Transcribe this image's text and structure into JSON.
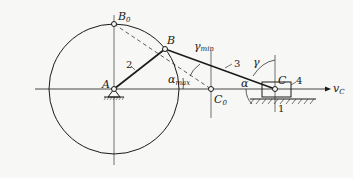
{
  "diagram": {
    "type": "slider-crank mechanism",
    "points": {
      "B0": {
        "label": "B",
        "sub": "0"
      },
      "B": {
        "label": "B"
      },
      "A": {
        "label": "A"
      },
      "C0": {
        "label": "C",
        "sub": "0"
      },
      "C": {
        "label": "C"
      }
    },
    "links": {
      "ground": "1",
      "crank": "2",
      "connecting_rod": "3",
      "slider": "4"
    },
    "angles": {
      "gamma_min": {
        "symbol": "γ",
        "sub": "min"
      },
      "gamma": {
        "symbol": "γ"
      },
      "alpha": {
        "symbol": "α"
      },
      "alpha_max": {
        "symbol": "α",
        "sub": "max"
      }
    },
    "velocity": {
      "symbol": "v",
      "sub": "C"
    },
    "colors": {
      "line": "#1a1a1a",
      "background": "#f7f7f5"
    }
  }
}
